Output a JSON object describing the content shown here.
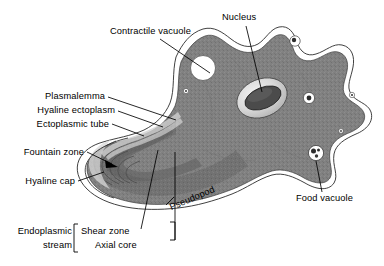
{
  "figure": {
    "background_color": "#ffffff",
    "cytoplasm_color": "#818181",
    "endoplasm_color": "#6e6e6e",
    "hyaline_color": "#ffffff",
    "outline_color": "#1a1a1a",
    "label_color": "#000000"
  },
  "labels": {
    "contractile_vacuole": "Contractile vacuole",
    "nucleus": "Nucleus",
    "plasmalemma": "Plasmalemma",
    "hyaline_ectoplasm": "Hyaline ectoplasm",
    "ectoplasmic_tube": "Ectoplasmic tube",
    "fountain_zone": "Fountain zone",
    "hyaline_cap": "Hyaline cap",
    "pseudopod": "Pseudopod",
    "food_vacuole": "Food vacuole",
    "endoplasmic_stream_line1": "Endoplasmic",
    "endoplasmic_stream_line2": "stream",
    "shear_zone": "Shear zone",
    "axial_core": "Axial core"
  },
  "structures": {
    "contractile_vacuole": {
      "kind": "clear-vacuole",
      "count": 1
    },
    "nucleus": {
      "kind": "ellipsoid-nucleus",
      "count": 1
    },
    "food_vacuole": {
      "kind": "vacuole-with-inclusions",
      "inclusions": 3
    },
    "small_vacuoles": {
      "count": 5
    },
    "pseudopod": {
      "kind": "lobose-pseudopod",
      "count": 1
    }
  }
}
